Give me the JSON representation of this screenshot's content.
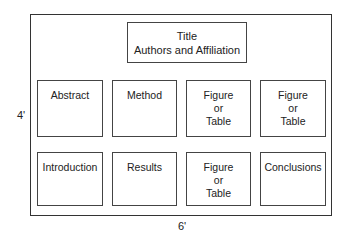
{
  "diagram": {
    "type": "poster-layout",
    "title_box": {
      "line1": "Title",
      "line2": "Authors and Affiliation"
    },
    "row1": [
      {
        "lines": [
          "Abstract"
        ]
      },
      {
        "lines": [
          "Method"
        ]
      },
      {
        "lines": [
          "Figure",
          "or",
          "Table"
        ]
      },
      {
        "lines": [
          "Figure",
          "or",
          "Table"
        ]
      }
    ],
    "row2": [
      {
        "lines": [
          "Introduction"
        ]
      },
      {
        "lines": [
          "Results"
        ]
      },
      {
        "lines": [
          "Figure",
          "or",
          "Table"
        ]
      },
      {
        "lines": [
          "Conclusions"
        ]
      }
    ],
    "height_label": "4'",
    "width_label": "6'"
  }
}
